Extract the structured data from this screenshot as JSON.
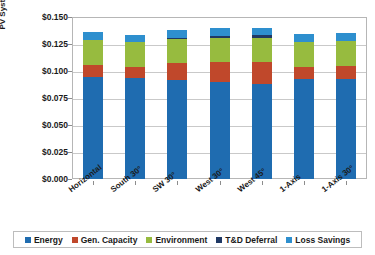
{
  "caption": "",
  "chart_data": {
    "type": "bar",
    "stacked": true,
    "title": "",
    "xlabel": "",
    "ylabel": "PV System Value (levelized $/kWh)",
    "ylim": [
      0.0,
      0.15
    ],
    "ytick_step": 0.025,
    "grid": true,
    "legend_position": "bottom",
    "categories": [
      "Horizontal",
      "South 30°",
      "SW 30°",
      "West 30°",
      "West 45°",
      "1-Axis",
      "1-Axis 30°"
    ],
    "ytick_labels": [
      "$0.000",
      "$0.025",
      "$0.050",
      "$0.075",
      "$0.100",
      "$0.125",
      "$0.150"
    ],
    "ytick_values": [
      0.0,
      0.025,
      0.05,
      0.075,
      0.1,
      0.125,
      0.15
    ],
    "series": [
      {
        "name": "Energy",
        "color": "#1f6cb0",
        "values": [
          0.0945,
          0.0935,
          0.092,
          0.09,
          0.088,
          0.093,
          0.093
        ]
      },
      {
        "name": "Gen. Capacity",
        "color": "#c0482b",
        "values": [
          0.011,
          0.0105,
          0.015,
          0.018,
          0.0205,
          0.011,
          0.012
        ]
      },
      {
        "name": "Environment",
        "color": "#97bb3f",
        "values": [
          0.0235,
          0.023,
          0.023,
          0.023,
          0.0225,
          0.023,
          0.023
        ]
      },
      {
        "name": "T&D Deferral",
        "color": "#1f3864",
        "values": [
          0.0,
          0.0,
          0.001,
          0.0015,
          0.002,
          0.0,
          0.0
        ]
      },
      {
        "name": "Loss Savings",
        "color": "#2e8fce",
        "values": [
          0.0075,
          0.006,
          0.007,
          0.0075,
          0.0065,
          0.0075,
          0.0075
        ]
      }
    ],
    "totals": [
      0.1365,
      0.133,
      0.138,
      0.14,
      0.1395,
      0.1345,
      0.1355
    ]
  },
  "legend": {
    "items": [
      {
        "label": "Energy"
      },
      {
        "label": "Gen. Capacity"
      },
      {
        "label": "Environment"
      },
      {
        "label": "T&D Deferral"
      },
      {
        "label": "Loss Savings"
      }
    ]
  }
}
